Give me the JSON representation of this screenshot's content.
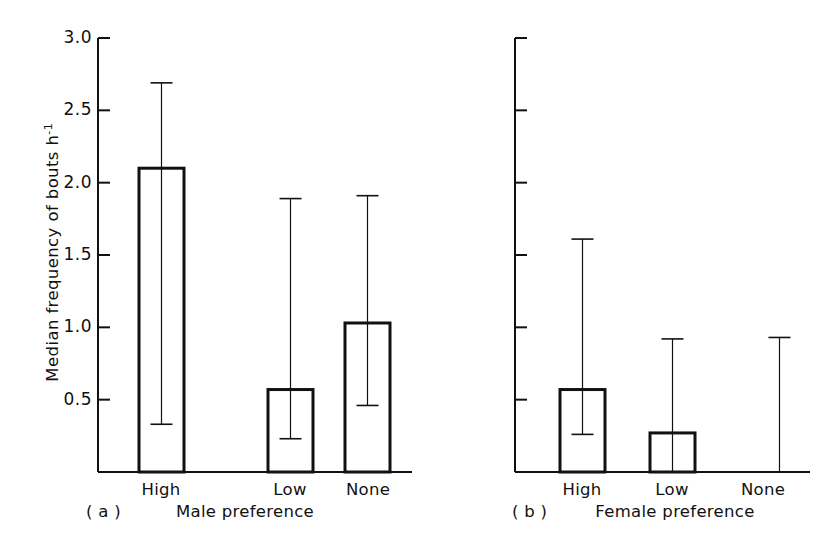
{
  "figure": {
    "ylabel_text": "Median frequency of bouts h",
    "ylabel_exponent": "-1",
    "background": "#ffffff",
    "ink_color": "#111111"
  },
  "chart_data": {
    "type": "bar",
    "title": "",
    "xlabel": "",
    "ylabel": "Median frequency of bouts h-1",
    "ylim": [
      0,
      3.0
    ],
    "grid": false,
    "legend": null,
    "yticks": [
      0.5,
      1.0,
      1.5,
      2.0,
      2.5,
      3.0
    ],
    "ytick_labels": [
      "0.5",
      "1.0",
      "1.5",
      "2.0",
      "2.5",
      "3.0"
    ],
    "panels": [
      {
        "tag": "( a )",
        "axis_title": "Male preference",
        "categories": [
          "High",
          "Low",
          "None"
        ],
        "values": [
          2.1,
          0.57,
          1.03
        ],
        "err_upper": [
          2.69,
          1.89,
          1.91
        ],
        "err_lower": [
          0.33,
          0.23,
          0.46
        ],
        "y_axis_labelled": true
      },
      {
        "tag": "( b )",
        "axis_title": "Female preference",
        "categories": [
          "High",
          "Low",
          "None"
        ],
        "values": [
          0.57,
          0.27,
          0.0
        ],
        "err_upper": [
          1.61,
          0.92,
          0.93
        ],
        "err_lower": [
          0.26,
          0.0,
          0.0
        ],
        "y_axis_labelled": false
      }
    ]
  }
}
